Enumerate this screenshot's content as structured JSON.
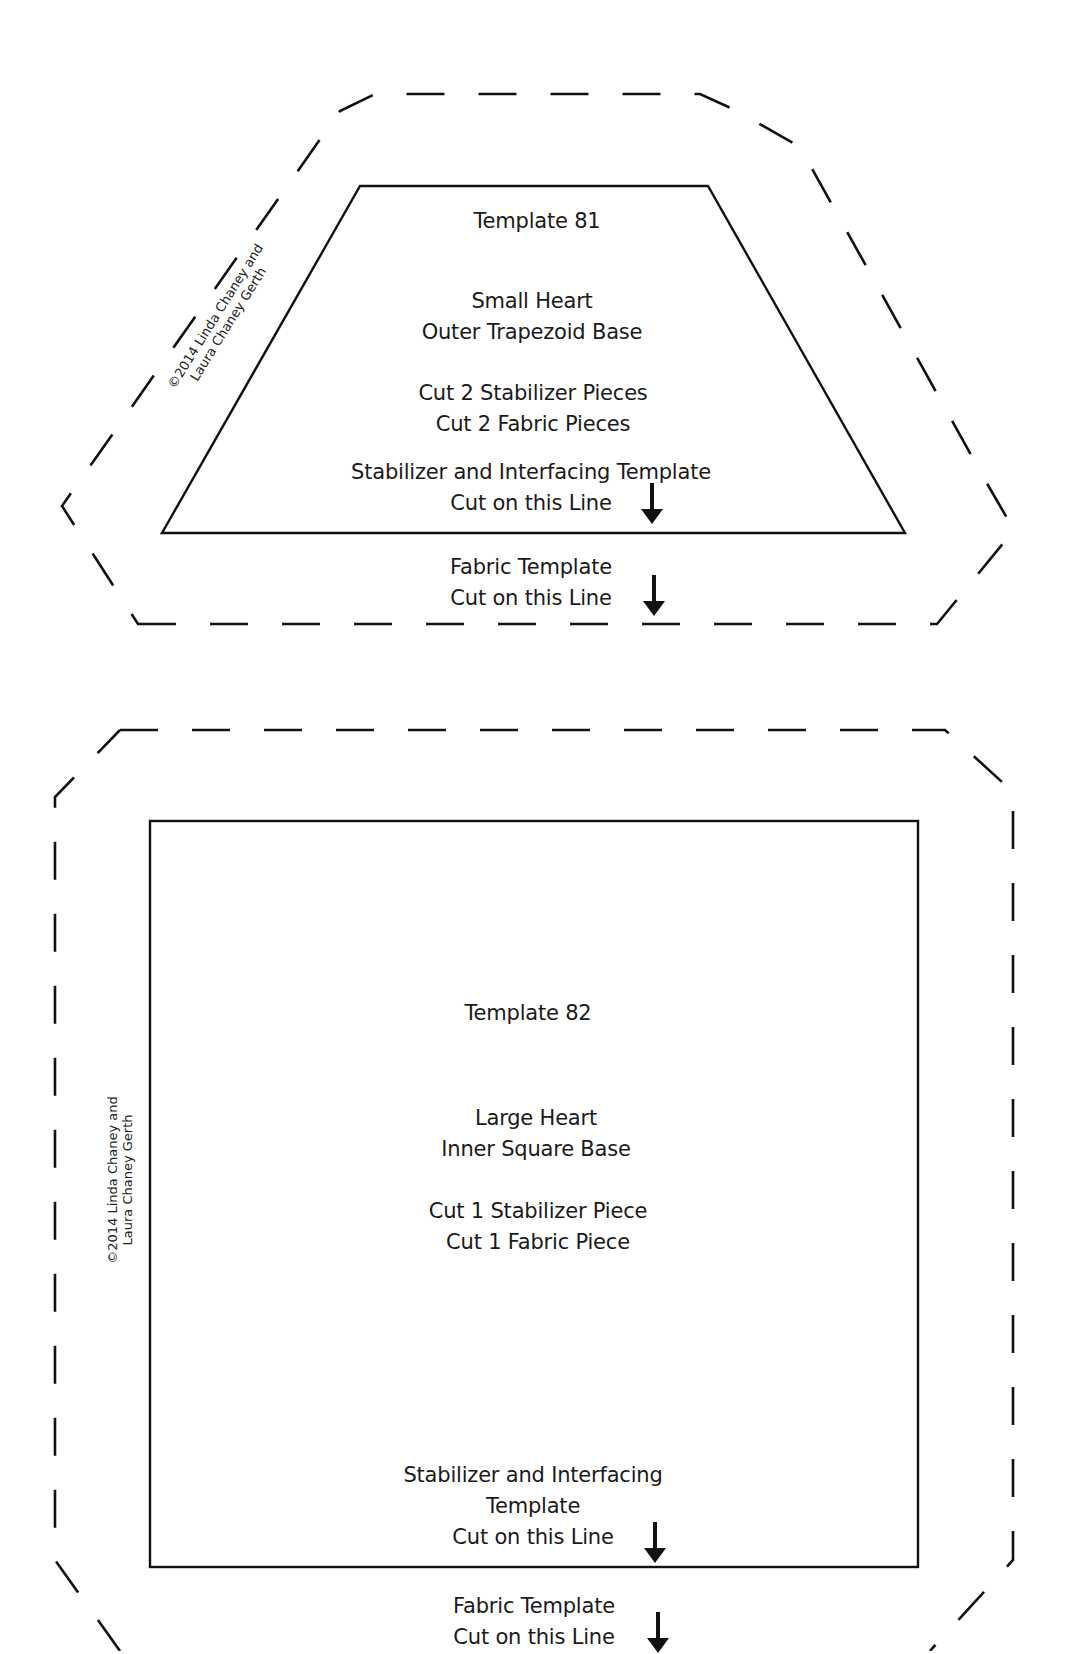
{
  "templates": [
    {
      "id": "81",
      "title": "Template 81",
      "description_lines": [
        "Small Heart",
        "Outer Trapezoid Base"
      ],
      "cut_lines": [
        "Cut 2 Stabilizer Pieces",
        "Cut 2 Fabric Pieces"
      ],
      "stabilizer_label_lines": [
        "Stabilizer and Interfacing Template",
        "Cut on this Line"
      ],
      "fabric_label_lines": [
        "Fabric Template",
        "Cut on this Line"
      ],
      "copyright_lines": [
        "©2014 Linda Chaney and",
        "Laura Chaney Gerth"
      ],
      "shape": "trapezoid",
      "arrow_icon": "down-arrow"
    },
    {
      "id": "82",
      "title": "Template 82",
      "description_lines": [
        "Large Heart",
        "Inner Square Base"
      ],
      "cut_lines": [
        "Cut 1 Stabilizer Piece",
        "Cut 1 Fabric Piece"
      ],
      "stabilizer_label_lines": [
        "Stabilizer and Interfacing",
        "Template",
        "Cut on this Line"
      ],
      "fabric_label_lines": [
        "Fabric Template",
        "Cut on this Line"
      ],
      "copyright_lines": [
        "©2014 Linda Chaney and",
        "Laura Chaney Gerth"
      ],
      "shape": "square",
      "arrow_icon": "down-arrow"
    }
  ],
  "colors": {
    "line": "#111111",
    "text": "#1a1a1a",
    "background": "#ffffff"
  }
}
